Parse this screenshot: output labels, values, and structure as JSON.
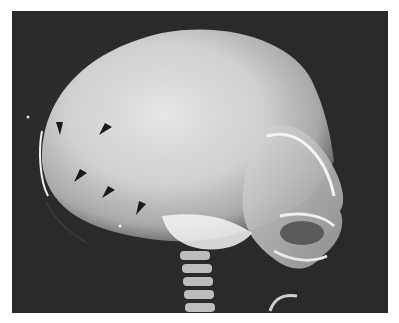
{
  "image": {
    "type": "radiograph",
    "view": "lateral skull",
    "description": "Lateral skull radiograph of an infant with arrowheads marking an abnormality of the vault",
    "background_color": "#2a2a2a",
    "frame_color": "#ffffff"
  },
  "annotations": {
    "arrowheads": [
      {
        "id": 1,
        "x": 59,
        "y": 126,
        "direction": "down"
      },
      {
        "id": 2,
        "x": 104,
        "y": 128,
        "direction": "down-left"
      },
      {
        "id": 3,
        "x": 79,
        "y": 174,
        "direction": "down-left"
      },
      {
        "id": 4,
        "x": 107,
        "y": 190,
        "direction": "down-left"
      },
      {
        "id": 5,
        "x": 140,
        "y": 206,
        "direction": "down-left"
      }
    ],
    "arrowhead_color": "#1a1a1a"
  }
}
